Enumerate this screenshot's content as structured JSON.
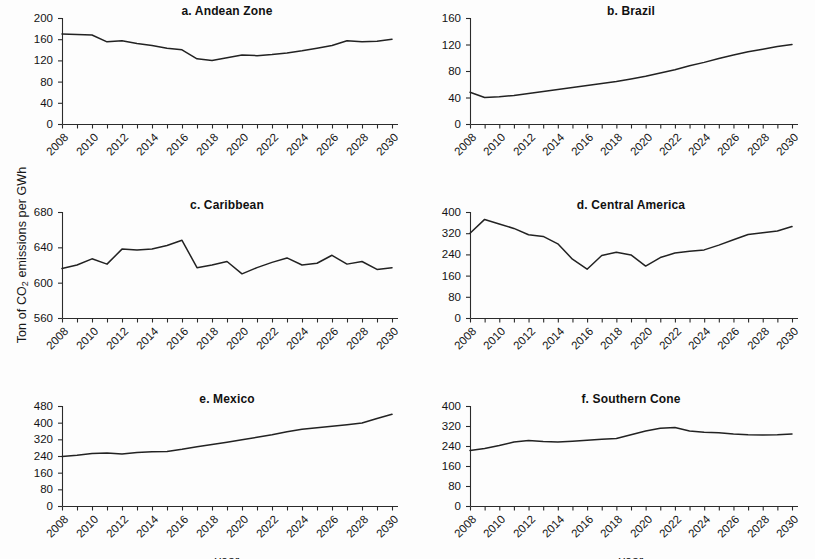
{
  "figure": {
    "ylabel": "Ton of CO2 emissions per GWh",
    "ylabel_prefix": "Ton of CO",
    "ylabel_sub": "2",
    "ylabel_suffix": " emissions per GWh",
    "xlabel": "year",
    "line_color": "#222222",
    "axis_color": "#2b2b2b",
    "background": "#fdfdfd"
  },
  "chart_data": [
    {
      "type": "line",
      "panel": "a",
      "title": "a. Andean Zone",
      "xlabel": "year",
      "ylabel": "Ton of CO2 emissions per GWh",
      "grid": false,
      "legend": "none",
      "xlim": [
        2008,
        2030
      ],
      "ylim": [
        0,
        200
      ],
      "yticks": [
        0,
        40,
        80,
        120,
        160,
        200
      ],
      "xticks": [
        2008,
        2010,
        2012,
        2014,
        2016,
        2018,
        2020,
        2022,
        2024,
        2026,
        2028,
        2030
      ],
      "x": [
        2008,
        2009,
        2010,
        2011,
        2012,
        2013,
        2014,
        2015,
        2016,
        2017,
        2018,
        2019,
        2020,
        2021,
        2022,
        2023,
        2024,
        2025,
        2026,
        2027,
        2028,
        2029,
        2030
      ],
      "values": [
        170,
        169,
        168,
        155,
        157,
        152,
        148,
        143,
        140,
        123,
        120,
        125,
        130,
        129,
        131,
        134,
        138,
        143,
        148,
        157,
        155,
        156,
        160
      ]
    },
    {
      "type": "line",
      "panel": "b",
      "title": "b. Brazil",
      "xlabel": "year",
      "ylabel": "Ton of CO2 emissions per GWh",
      "grid": false,
      "legend": "none",
      "xlim": [
        2008,
        2030
      ],
      "ylim": [
        0,
        160
      ],
      "yticks": [
        0,
        40,
        80,
        120,
        160
      ],
      "xticks": [
        2008,
        2010,
        2012,
        2014,
        2016,
        2018,
        2020,
        2022,
        2024,
        2026,
        2028,
        2030
      ],
      "x": [
        2008,
        2009,
        2010,
        2011,
        2012,
        2013,
        2014,
        2015,
        2016,
        2017,
        2018,
        2019,
        2020,
        2021,
        2022,
        2023,
        2024,
        2025,
        2026,
        2027,
        2028,
        2029,
        2030
      ],
      "values": [
        48,
        40,
        41,
        43,
        46,
        49,
        52,
        55,
        58,
        61,
        64,
        68,
        72,
        77,
        82,
        88,
        93,
        99,
        104,
        109,
        113,
        117,
        120
      ]
    },
    {
      "type": "line",
      "panel": "c",
      "title": "c. Caribbean",
      "xlabel": "year",
      "ylabel": "Ton of CO2 emissions per GWh",
      "grid": false,
      "legend": "none",
      "xlim": [
        2008,
        2030
      ],
      "ylim": [
        560,
        680
      ],
      "yticks": [
        560,
        600,
        640,
        680
      ],
      "xticks": [
        2008,
        2010,
        2012,
        2014,
        2016,
        2018,
        2020,
        2022,
        2024,
        2026,
        2028,
        2030
      ],
      "x": [
        2008,
        2009,
        2010,
        2011,
        2012,
        2013,
        2014,
        2015,
        2016,
        2017,
        2018,
        2019,
        2020,
        2021,
        2022,
        2023,
        2024,
        2025,
        2026,
        2027,
        2028,
        2029,
        2030
      ],
      "values": [
        616,
        620,
        627,
        621,
        638,
        637,
        638,
        642,
        648,
        617,
        620,
        624,
        610,
        617,
        623,
        628,
        620,
        622,
        631,
        621,
        624,
        615,
        617
      ]
    },
    {
      "type": "line",
      "panel": "d",
      "title": "d. Central America",
      "xlabel": "year",
      "ylabel": "Ton of CO2 emissions per GWh",
      "grid": false,
      "legend": "none",
      "xlim": [
        2008,
        2030
      ],
      "ylim": [
        0,
        400
      ],
      "yticks": [
        0,
        80,
        160,
        240,
        320,
        400
      ],
      "xticks": [
        2008,
        2010,
        2012,
        2014,
        2016,
        2018,
        2020,
        2022,
        2024,
        2026,
        2028,
        2030
      ],
      "x": [
        2008,
        2009,
        2010,
        2011,
        2012,
        2013,
        2014,
        2015,
        2016,
        2017,
        2018,
        2019,
        2020,
        2021,
        2022,
        2023,
        2024,
        2025,
        2026,
        2027,
        2028,
        2029,
        2030
      ],
      "values": [
        320,
        372,
        355,
        338,
        314,
        308,
        280,
        222,
        184,
        236,
        248,
        238,
        196,
        228,
        245,
        252,
        257,
        275,
        295,
        315,
        322,
        328,
        345
      ]
    },
    {
      "type": "line",
      "panel": "e",
      "title": "e. Mexico",
      "xlabel": "year",
      "ylabel": "Ton of CO2 emissions per GWh",
      "grid": false,
      "legend": "none",
      "xlim": [
        2008,
        2030
      ],
      "ylim": [
        0,
        480
      ],
      "yticks": [
        0,
        80,
        160,
        240,
        320,
        400,
        480
      ],
      "xticks": [
        2008,
        2010,
        2012,
        2014,
        2016,
        2018,
        2020,
        2022,
        2024,
        2026,
        2028,
        2030
      ],
      "x": [
        2008,
        2009,
        2010,
        2011,
        2012,
        2013,
        2014,
        2015,
        2016,
        2017,
        2018,
        2019,
        2020,
        2021,
        2022,
        2023,
        2024,
        2025,
        2026,
        2027,
        2028,
        2029,
        2030
      ],
      "values": [
        238,
        244,
        252,
        254,
        249,
        257,
        260,
        262,
        272,
        284,
        295,
        306,
        318,
        330,
        342,
        356,
        368,
        376,
        383,
        390,
        398,
        420,
        440
      ]
    },
    {
      "type": "line",
      "panel": "f",
      "title": "f. Southern Cone",
      "xlabel": "year",
      "ylabel": "Ton of CO2 emissions per GWh",
      "grid": false,
      "legend": "none",
      "xlim": [
        2008,
        2030
      ],
      "ylim": [
        0,
        400
      ],
      "yticks": [
        0,
        80,
        160,
        240,
        320,
        400
      ],
      "xticks": [
        2008,
        2010,
        2012,
        2014,
        2016,
        2018,
        2020,
        2022,
        2024,
        2026,
        2028,
        2030
      ],
      "x": [
        2008,
        2009,
        2010,
        2011,
        2012,
        2013,
        2014,
        2015,
        2016,
        2017,
        2018,
        2019,
        2020,
        2021,
        2022,
        2023,
        2024,
        2025,
        2026,
        2027,
        2028,
        2029,
        2030
      ],
      "values": [
        222,
        230,
        242,
        256,
        262,
        258,
        256,
        259,
        263,
        267,
        270,
        285,
        300,
        311,
        314,
        300,
        295,
        293,
        288,
        285,
        284,
        285,
        288
      ]
    }
  ]
}
